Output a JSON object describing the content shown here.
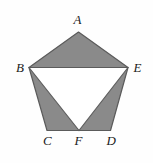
{
  "figure": {
    "canvas": {
      "width": 153,
      "height": 163
    },
    "colors": {
      "background": "#fefefe",
      "shaded_fill": "#8a8a8a",
      "unshaded_fill": "#ffffff",
      "stroke": "#5b5b5b"
    },
    "stroke_width": 1.2,
    "vertices": [
      {
        "name": "A",
        "x": 78.5,
        "y": 32.0,
        "label": "A",
        "label_x": 73.5,
        "label_y": 13.0
      },
      {
        "name": "B",
        "x": 29.0,
        "y": 67.5,
        "label": "B",
        "label_x": 16.0,
        "label_y": 60.5
      },
      {
        "name": "C",
        "x": 47.0,
        "y": 130.5,
        "label": "C",
        "label_x": 43.0,
        "label_y": 133.5
      },
      {
        "name": "D",
        "x": 110.5,
        "y": 130.5,
        "label": "D",
        "label_x": 106.5,
        "label_y": 133.5
      },
      {
        "name": "E",
        "x": 128.0,
        "y": 67.5,
        "label": "E",
        "label_x": 133.5,
        "label_y": 60.5
      },
      {
        "name": "F",
        "x": 79.0,
        "y": 130.5,
        "label": "F",
        "label_x": 74.5,
        "label_y": 133.5
      }
    ],
    "shaded_polygons": [
      {
        "name": "top-triangle-ABE",
        "points": "78.5,32.0 128.0,67.5 29.0,67.5"
      },
      {
        "name": "left-region-BCF",
        "points": "29.0,67.5 47.0,130.5 79.0,130.5"
      },
      {
        "name": "right-region-FDE",
        "points": "79.0,130.5 110.5,130.5 128.0,67.5"
      }
    ],
    "unshaded_polygons": [
      {
        "name": "inner-triangle-BEF",
        "points": "29.0,67.5 128.0,67.5 79.0,130.5"
      }
    ],
    "outline_polygon": {
      "name": "pentagon-ABCDE",
      "points": "78.5,32.0 128.0,67.5 110.5,130.5 47.0,130.5 29.0,67.5"
    },
    "inner_segments": [
      {
        "name": "segment-BE",
        "x1": 29.0,
        "y1": 67.5,
        "x2": 128.0,
        "y2": 67.5
      },
      {
        "name": "segment-BF",
        "x1": 29.0,
        "y1": 67.5,
        "x2": 79.0,
        "y2": 130.5
      },
      {
        "name": "segment-EF",
        "x1": 128.0,
        "y1": 67.5,
        "x2": 79.0,
        "y2": 130.5
      }
    ]
  }
}
